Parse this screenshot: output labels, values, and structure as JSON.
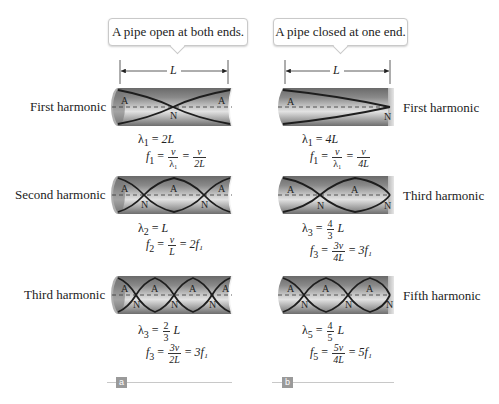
{
  "panels": {
    "a": {
      "callout": "A pipe open at both ends.",
      "length_label": "L",
      "marker": "a",
      "rows": [
        {
          "harmonic_label": "First harmonic",
          "wavelength": {
            "sym": "λ",
            "sub": "1",
            "rhs": "2L"
          },
          "frequency": {
            "sym": "f",
            "sub": "1",
            "eq1_num": "v",
            "eq1_den": "λ₁",
            "eq2_num": "v",
            "eq2_den": "2L",
            "result": ""
          },
          "antinodes": [
            "A",
            "A"
          ],
          "nodes": [
            "N"
          ]
        },
        {
          "harmonic_label": "Second harmonic",
          "wavelength": {
            "sym": "λ",
            "sub": "2",
            "rhs": "L"
          },
          "frequency": {
            "sym": "f",
            "sub": "2",
            "eq1_num": "v",
            "eq1_den": "L",
            "result": "2f₁"
          },
          "antinodes": [
            "A",
            "A",
            "A"
          ],
          "nodes": [
            "N",
            "N"
          ]
        },
        {
          "harmonic_label": "Third harmonic",
          "wavelength": {
            "sym": "λ",
            "sub": "3",
            "frac_num": "2",
            "frac_den": "3",
            "rhs": "L"
          },
          "frequency": {
            "sym": "f",
            "sub": "3",
            "eq1_num": "3v",
            "eq1_den": "2L",
            "result": "3f₁"
          },
          "antinodes": [
            "A",
            "A",
            "A",
            "A"
          ],
          "nodes": [
            "N",
            "N",
            "N"
          ]
        }
      ]
    },
    "b": {
      "callout": "A pipe closed at one end.",
      "length_label": "L",
      "marker": "b",
      "rows": [
        {
          "harmonic_label": "First harmonic",
          "wavelength": {
            "sym": "λ",
            "sub": "1",
            "rhs": "4L"
          },
          "frequency": {
            "sym": "f",
            "sub": "1",
            "eq1_num": "v",
            "eq1_den": "λ₁",
            "eq2_num": "v",
            "eq2_den": "4L"
          },
          "antinodes": [
            "A"
          ],
          "nodes": [
            "N"
          ]
        },
        {
          "harmonic_label": "Third harmonic",
          "wavelength": {
            "sym": "λ",
            "sub": "3",
            "frac_num": "4",
            "frac_den": "3",
            "rhs": "L"
          },
          "frequency": {
            "sym": "f",
            "sub": "3",
            "eq1_num": "3v",
            "eq1_den": "4L",
            "result": "3f₁"
          },
          "antinodes": [
            "A",
            "A"
          ],
          "nodes": [
            "N",
            "N"
          ]
        },
        {
          "harmonic_label": "Fifth harmonic",
          "wavelength": {
            "sym": "λ",
            "sub": "5",
            "frac_num": "4",
            "frac_den": "5",
            "rhs": "L"
          },
          "frequency": {
            "sym": "f",
            "sub": "5",
            "eq1_num": "5v",
            "eq1_den": "4L",
            "result": "5f₁"
          },
          "antinodes": [
            "A",
            "A",
            "A"
          ],
          "nodes": [
            "N",
            "N",
            "N"
          ]
        }
      ]
    }
  },
  "symbols": {
    "equals": "=",
    "node": "N",
    "antinode": "A"
  },
  "colors": {
    "pipe_dark": "#5a5a5a",
    "pipe_mid": "#9a9a9a",
    "pipe_light": "#d8d8d8",
    "wave": "#1e1e1e",
    "marker_bg": "#9a9a9a"
  }
}
